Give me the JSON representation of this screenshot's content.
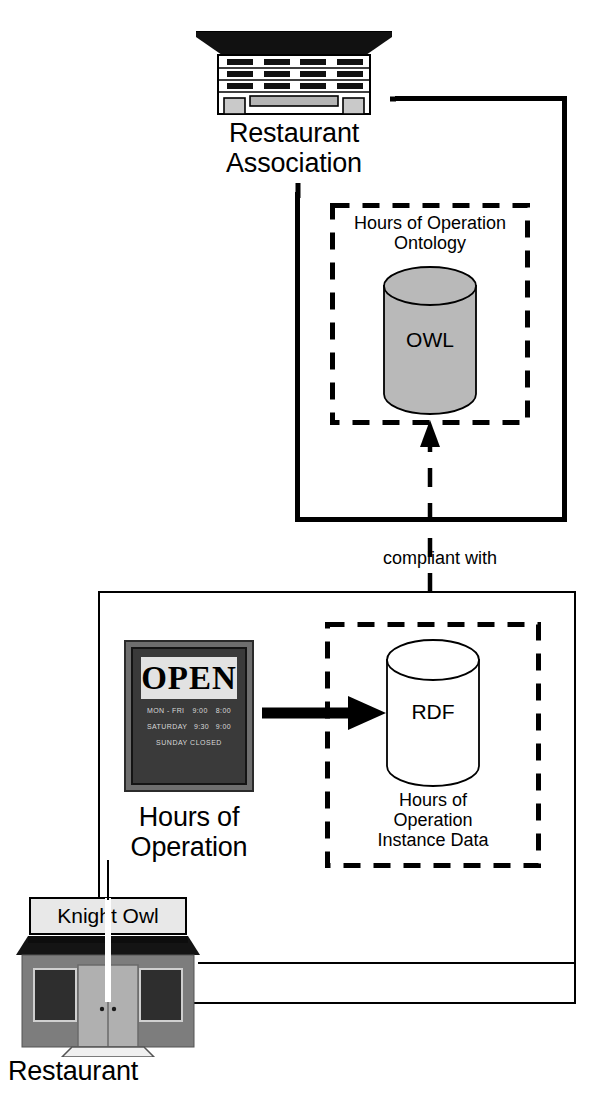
{
  "diagram": {
    "nodes": {
      "association": {
        "icon": "office-building-icon",
        "label_line1": "Restaurant",
        "label_line2": "Association"
      },
      "ontology_box": {
        "label_line1": "Hours of Operation",
        "label_line2": "Ontology",
        "cylinder_label": "OWL",
        "cylinder_fill": "#b9b9b9"
      },
      "instance_box": {
        "cylinder_label": "RDF",
        "label_line1": "Hours of",
        "label_line2": "Operation",
        "label_line3": "Instance Data",
        "cylinder_fill": "#ffffff"
      },
      "sign": {
        "icon": "open-sign-icon",
        "headline": "OPEN",
        "rows": [
          {
            "days": "MON - FRI",
            "open": "9:00",
            "close": "8:00"
          },
          {
            "days": "SATURDAY",
            "open": "9:30",
            "close": "9:00"
          }
        ],
        "closed_note": "SUNDAY CLOSED",
        "label_line1": "Hours of",
        "label_line2": "Operation"
      },
      "restaurant": {
        "icon": "storefront-icon",
        "sign_name": "Knight Owl",
        "label": "Restaurant"
      }
    },
    "edges": {
      "compliant_with": "compliant with"
    },
    "colors": {
      "stroke": "#000000",
      "cylinder_gray": "#b9b9b9",
      "building_gray": "#b4b4b4",
      "shop_wall": "#7d7d7d",
      "shop_roof": "#141414",
      "shop_window": "#2e2e2e",
      "shop_door": "#b0b0b0",
      "sign_frame": "#6e6e6e",
      "sign_face": "#3a3a3a",
      "background": "#ffffff"
    }
  }
}
